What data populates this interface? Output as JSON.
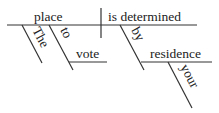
{
  "diagram": {
    "type": "sentence-diagram",
    "words": {
      "subject": "place",
      "predicate": "is determined",
      "subject_article": "The",
      "infinitive_marker": "to",
      "infinitive_verb": "vote",
      "preposition": "by",
      "prepositional_object": "residence",
      "object_modifier": "your"
    },
    "line_color": "#333333",
    "text_color": "#222222"
  }
}
